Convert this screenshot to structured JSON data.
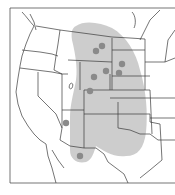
{
  "map": {
    "region": "Western and Central United States",
    "frame": {
      "x": 10,
      "y": 8,
      "w": 170,
      "h": 175
    },
    "colors": {
      "background": "#ffffff",
      "range_fill": "#c8c8c8",
      "dot_fill": "#8a8a8a",
      "border_line": "#3a3a3a"
    },
    "range_label": "distribution-range",
    "dots": [
      {
        "x": 96,
        "y": 51
      },
      {
        "x": 102,
        "y": 46
      },
      {
        "x": 122,
        "y": 64
      },
      {
        "x": 119,
        "y": 73
      },
      {
        "x": 106,
        "y": 71
      },
      {
        "x": 94,
        "y": 77
      },
      {
        "x": 90,
        "y": 91
      },
      {
        "x": 66,
        "y": 123
      },
      {
        "x": 80,
        "y": 156
      }
    ]
  }
}
